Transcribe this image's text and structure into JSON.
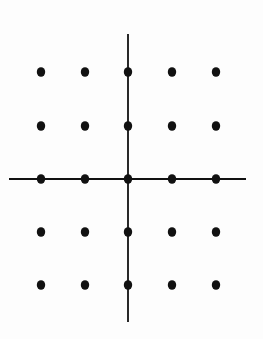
{
  "diagram": {
    "type": "integer-lattice-grid",
    "colors": {
      "background": "#fdfdfd",
      "ink": "#111111"
    },
    "axes": {
      "horizontal": {
        "x1": 9,
        "x2": 246,
        "y": 179,
        "stroke_width": 2.2
      },
      "vertical": {
        "x": 128,
        "y1": 34,
        "y2": 322,
        "stroke_width": 1.8
      }
    },
    "columns_x": [
      41,
      85,
      128,
      172,
      216
    ],
    "rows_y": [
      72,
      126,
      179,
      232,
      285
    ],
    "dot": {
      "rx": 4.2,
      "ry": 4.8
    },
    "points": [
      {
        "i": -2,
        "j": 2
      },
      {
        "i": -1,
        "j": 2
      },
      {
        "i": 0,
        "j": 2
      },
      {
        "i": 1,
        "j": 2
      },
      {
        "i": 2,
        "j": 2
      },
      {
        "i": -2,
        "j": 1
      },
      {
        "i": -1,
        "j": 1
      },
      {
        "i": 0,
        "j": 1
      },
      {
        "i": 1,
        "j": 1
      },
      {
        "i": 2,
        "j": 1
      },
      {
        "i": -2,
        "j": 0
      },
      {
        "i": -1,
        "j": 0
      },
      {
        "i": 0,
        "j": 0
      },
      {
        "i": 1,
        "j": 0
      },
      {
        "i": 2,
        "j": 0
      },
      {
        "i": -2,
        "j": -1
      },
      {
        "i": -1,
        "j": -1
      },
      {
        "i": 0,
        "j": -1
      },
      {
        "i": 1,
        "j": -1
      },
      {
        "i": 2,
        "j": -1
      },
      {
        "i": -2,
        "j": -2
      },
      {
        "i": -1,
        "j": -2
      },
      {
        "i": 0,
        "j": -2
      },
      {
        "i": 1,
        "j": -2
      },
      {
        "i": 2,
        "j": -2
      }
    ]
  }
}
